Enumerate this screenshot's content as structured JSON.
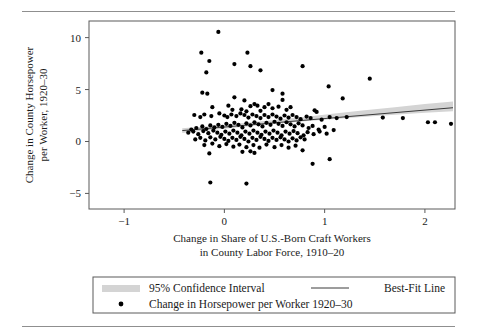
{
  "chart_data": {
    "type": "scatter",
    "title": "",
    "xlabel": "Change in Share of U.S.-Born Craft Workers in County Labor Force, 1910–20",
    "xlabel_line1": "Change in Share of U.S.-Born Craft Workers",
    "xlabel_line2": "in County Labor Force, 1910–20",
    "ylabel": "Change in County Horsepower per Worker, 1920–30",
    "ylabel_line1": "Change in County Horsepower",
    "ylabel_line2": "per Worker, 1920–30",
    "xlim": [
      -1.35,
      2.3
    ],
    "ylim": [
      -6.5,
      11.6
    ],
    "xticks": [
      -1,
      0,
      1,
      2
    ],
    "xtick_labels": [
      "−1",
      "0",
      "1",
      "2"
    ],
    "yticks": [
      10,
      5,
      0,
      -5
    ],
    "ytick_labels": [
      "10",
      "5",
      "0",
      "−5"
    ],
    "grid": false,
    "legend_position": "bottom",
    "colors": {
      "point": "#000000",
      "fit_line": "#3a3a3a",
      "ci_band": "#d4d4d4",
      "frame": "#5a5a5a",
      "rule": "#8f8f8f"
    },
    "fit_line": {
      "x": [
        -0.42,
        2.28
      ],
      "y": [
        1.05,
        3.25
      ]
    },
    "ci_band": {
      "x": [
        -0.42,
        -0.1,
        0.2,
        0.5,
        0.8,
        1.1,
        1.4,
        1.7,
        2.0,
        2.28
      ],
      "upper": [
        1.28,
        1.52,
        1.78,
        2.06,
        2.36,
        2.7,
        3.0,
        3.3,
        3.6,
        3.85
      ],
      "lower": [
        0.82,
        1.14,
        1.42,
        1.7,
        1.96,
        2.16,
        2.38,
        2.58,
        2.76,
        2.92
      ]
    },
    "series": [
      {
        "name": "Change in Horsepower per Worker 1920–30",
        "marker": "circle",
        "points": [
          [
            -0.06,
            10.55
          ],
          [
            -0.23,
            8.55
          ],
          [
            0.23,
            8.55
          ],
          [
            -0.15,
            7.75
          ],
          [
            0.1,
            7.45
          ],
          [
            0.26,
            7.25
          ],
          [
            0.78,
            7.25
          ],
          [
            -0.18,
            6.65
          ],
          [
            0.36,
            6.85
          ],
          [
            1.45,
            6.05
          ],
          [
            1.04,
            5.3
          ],
          [
            -0.22,
            4.7
          ],
          [
            -0.17,
            4.6
          ],
          [
            0.48,
            4.95
          ],
          [
            0.58,
            4.6
          ],
          [
            0.1,
            4.25
          ],
          [
            1.18,
            4.15
          ],
          [
            0.58,
            4.0
          ],
          [
            0.2,
            3.95
          ],
          [
            -0.12,
            3.3
          ],
          [
            0.04,
            3.45
          ],
          [
            0.26,
            3.4
          ],
          [
            0.33,
            3.45
          ],
          [
            0.4,
            3.3
          ],
          [
            0.48,
            3.2
          ],
          [
            0.54,
            3.35
          ],
          [
            0.62,
            3.05
          ],
          [
            0.17,
            3.1
          ],
          [
            0.08,
            3.05
          ],
          [
            0.3,
            3.6
          ],
          [
            0.44,
            3.6
          ],
          [
            0.66,
            3.3
          ],
          [
            0.36,
            2.95
          ],
          [
            0.22,
            2.9
          ],
          [
            -0.3,
            2.55
          ],
          [
            -0.24,
            2.35
          ],
          [
            -0.2,
            2.6
          ],
          [
            -0.13,
            2.45
          ],
          [
            -0.05,
            2.7
          ],
          [
            0.0,
            2.5
          ],
          [
            0.03,
            2.35
          ],
          [
            0.07,
            2.6
          ],
          [
            0.12,
            2.45
          ],
          [
            0.16,
            2.7
          ],
          [
            0.2,
            2.55
          ],
          [
            0.24,
            2.3
          ],
          [
            0.28,
            2.6
          ],
          [
            0.32,
            2.45
          ],
          [
            0.36,
            2.25
          ],
          [
            0.4,
            2.55
          ],
          [
            0.44,
            2.35
          ],
          [
            0.48,
            2.6
          ],
          [
            0.52,
            2.4
          ],
          [
            0.56,
            2.2
          ],
          [
            0.6,
            2.5
          ],
          [
            0.64,
            2.3
          ],
          [
            0.68,
            2.55
          ],
          [
            0.72,
            2.35
          ],
          [
            0.76,
            2.15
          ],
          [
            0.82,
            2.4
          ],
          [
            0.86,
            2.25
          ],
          [
            0.9,
            3.0
          ],
          [
            0.92,
            2.85
          ],
          [
            0.97,
            2.1
          ],
          [
            1.05,
            2.35
          ],
          [
            1.12,
            2.25
          ],
          [
            1.22,
            2.35
          ],
          [
            1.58,
            2.3
          ],
          [
            1.78,
            2.25
          ],
          [
            2.03,
            1.85
          ],
          [
            2.1,
            1.85
          ],
          [
            2.26,
            1.7
          ],
          [
            -0.33,
            1.15
          ],
          [
            -0.28,
            1.3
          ],
          [
            -0.22,
            1.45
          ],
          [
            -0.18,
            1.2
          ],
          [
            -0.14,
            1.55
          ],
          [
            -0.1,
            1.35
          ],
          [
            -0.06,
            1.6
          ],
          [
            -0.02,
            1.4
          ],
          [
            0.02,
            1.7
          ],
          [
            0.06,
            1.5
          ],
          [
            0.1,
            1.8
          ],
          [
            0.14,
            1.6
          ],
          [
            0.18,
            1.35
          ],
          [
            0.22,
            1.75
          ],
          [
            0.26,
            1.55
          ],
          [
            0.3,
            1.85
          ],
          [
            0.34,
            1.65
          ],
          [
            0.38,
            1.45
          ],
          [
            0.42,
            1.8
          ],
          [
            0.46,
            1.6
          ],
          [
            0.5,
            1.9
          ],
          [
            0.54,
            1.7
          ],
          [
            0.58,
            1.5
          ],
          [
            0.62,
            1.85
          ],
          [
            0.66,
            1.65
          ],
          [
            0.7,
            1.45
          ],
          [
            0.74,
            1.75
          ],
          [
            0.78,
            1.55
          ],
          [
            0.84,
            1.3
          ],
          [
            0.88,
            1.5
          ],
          [
            0.94,
            1.15
          ],
          [
            1.0,
            1.4
          ],
          [
            1.09,
            1.1
          ],
          [
            -0.36,
            0.85
          ],
          [
            -0.31,
            0.95
          ],
          [
            -0.26,
            0.7
          ],
          [
            -0.21,
            1.0
          ],
          [
            -0.16,
            0.8
          ],
          [
            -0.11,
            1.05
          ],
          [
            -0.07,
            0.85
          ],
          [
            -0.03,
            0.65
          ],
          [
            0.01,
            0.95
          ],
          [
            0.05,
            0.75
          ],
          [
            0.09,
            1.05
          ],
          [
            0.13,
            0.85
          ],
          [
            0.17,
            0.6
          ],
          [
            0.21,
            0.95
          ],
          [
            0.25,
            0.75
          ],
          [
            0.29,
            1.05
          ],
          [
            0.33,
            0.85
          ],
          [
            0.37,
            0.65
          ],
          [
            0.41,
            0.95
          ],
          [
            0.45,
            0.75
          ],
          [
            0.49,
            1.05
          ],
          [
            0.53,
            0.85
          ],
          [
            0.57,
            0.6
          ],
          [
            0.61,
            0.95
          ],
          [
            0.65,
            0.75
          ],
          [
            0.69,
            1.0
          ],
          [
            0.73,
            0.8
          ],
          [
            0.79,
            0.6
          ],
          [
            0.83,
            0.9
          ],
          [
            0.89,
            0.7
          ],
          [
            0.95,
            0.95
          ],
          [
            1.02,
            0.75
          ],
          [
            -0.29,
            0.2
          ],
          [
            -0.24,
            0.35
          ],
          [
            -0.19,
            0.1
          ],
          [
            -0.14,
            0.4
          ],
          [
            -0.09,
            0.2
          ],
          [
            -0.04,
            0.45
          ],
          [
            0.0,
            0.25
          ],
          [
            0.04,
            0.05
          ],
          [
            0.08,
            0.35
          ],
          [
            0.12,
            0.15
          ],
          [
            0.16,
            0.45
          ],
          [
            0.2,
            0.25
          ],
          [
            0.24,
            0.0
          ],
          [
            0.28,
            0.35
          ],
          [
            0.32,
            0.15
          ],
          [
            0.36,
            0.45
          ],
          [
            0.4,
            0.25
          ],
          [
            0.44,
            0.05
          ],
          [
            0.48,
            0.35
          ],
          [
            0.52,
            0.15
          ],
          [
            0.56,
            0.4
          ],
          [
            0.6,
            0.2
          ],
          [
            0.64,
            0.0
          ],
          [
            0.68,
            0.3
          ],
          [
            0.72,
            0.1
          ],
          [
            0.76,
            0.4
          ],
          [
            0.8,
            0.2
          ],
          [
            -0.2,
            -0.35
          ],
          [
            -0.12,
            -0.2
          ],
          [
            -0.05,
            -0.45
          ],
          [
            0.02,
            -0.25
          ],
          [
            0.09,
            -0.5
          ],
          [
            0.15,
            -0.3
          ],
          [
            0.22,
            -0.55
          ],
          [
            0.29,
            -0.35
          ],
          [
            0.35,
            -0.6
          ],
          [
            0.42,
            -0.3
          ],
          [
            0.5,
            -0.55
          ],
          [
            0.57,
            -0.35
          ],
          [
            0.64,
            -0.6
          ],
          [
            0.71,
            -0.4
          ],
          [
            0.78,
            -0.85
          ],
          [
            -0.15,
            -1.15
          ],
          [
            0.18,
            -1.0
          ],
          [
            0.3,
            -1.1
          ],
          [
            0.26,
            -0.95
          ],
          [
            0.88,
            -2.15
          ],
          [
            1.05,
            -1.7
          ],
          [
            -0.14,
            -3.95
          ],
          [
            0.22,
            -4.05
          ]
        ]
      }
    ],
    "legend": {
      "ci_label": "95% Confidence Interval",
      "fit_label": "Best-Fit Line",
      "points_label": "Change in Horsepower per Worker 1920–30"
    }
  }
}
